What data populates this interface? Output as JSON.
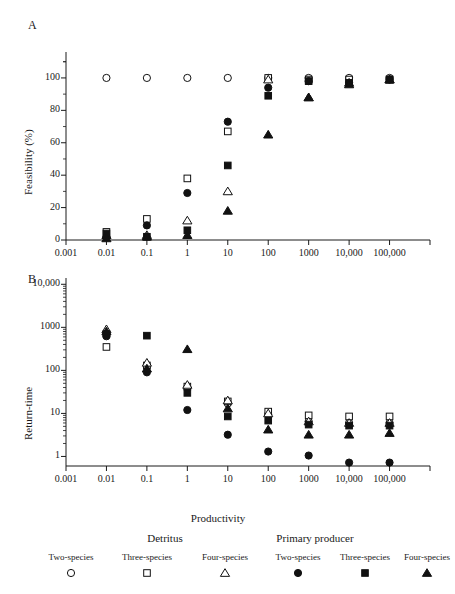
{
  "figure": {
    "panel_a_letter": "A",
    "panel_b_letter": "B",
    "xlabel": "Productivity"
  },
  "legend": {
    "group_detritus": "Detritus",
    "group_primary": "Primary producer",
    "entries": [
      {
        "label": "Two-species",
        "marker": "open-circle",
        "group": "Detritus"
      },
      {
        "label": "Three-species",
        "marker": "open-square",
        "group": "Detritus"
      },
      {
        "label": "Four-species",
        "marker": "open-triangle",
        "group": "Detritus"
      },
      {
        "label": "Two-species",
        "marker": "filled-circle",
        "group": "Primary producer"
      },
      {
        "label": "Three-species",
        "marker": "filled-square",
        "group": "Primary producer"
      },
      {
        "label": "Four-species",
        "marker": "filled-triangle",
        "group": "Primary producer"
      }
    ]
  },
  "chart_data": [
    {
      "type": "scatter",
      "panel": "A",
      "title": "",
      "xlabel": "Productivity",
      "ylabel": "Feasibility (%)",
      "xscale": "log",
      "yscale": "linear",
      "xlim": [
        0.001,
        1000000
      ],
      "ylim": [
        0,
        110
      ],
      "xticks": [
        0.001,
        0.01,
        0.1,
        1,
        10,
        100,
        1000,
        10000,
        100000
      ],
      "xticklabels": [
        "0.001",
        "0.01",
        "0.1",
        "1",
        "10",
        "100",
        "1000",
        "10,000",
        "100,000"
      ],
      "yticks": [
        0,
        20,
        40,
        60,
        80,
        100
      ],
      "yticklabels": [
        "0",
        "20",
        "40",
        "60",
        "80",
        "100"
      ],
      "grid": false,
      "legend_position": "below-figure",
      "series": [
        {
          "name": "Detritus Two-species",
          "marker": "open-circle",
          "x": [
            0.01,
            0.1,
            1,
            10,
            100,
            1000,
            10000,
            100000
          ],
          "y": [
            100,
            100,
            100,
            100,
            100,
            100,
            100,
            100
          ]
        },
        {
          "name": "Detritus Three-species",
          "marker": "open-square",
          "x": [
            0.01,
            0.1,
            1,
            10,
            100,
            1000,
            10000,
            100000
          ],
          "y": [
            5,
            13,
            38,
            67,
            100,
            99,
            99,
            99
          ]
        },
        {
          "name": "Detritus Four-species",
          "marker": "open-triangle",
          "x": [
            0.01,
            0.1,
            1,
            10,
            100,
            1000,
            10000,
            100000
          ],
          "y": [
            3,
            3,
            12,
            30,
            99,
            88,
            97,
            99
          ]
        },
        {
          "name": "Primary producer Two-species",
          "marker": "filled-circle",
          "x": [
            0.01,
            0.1,
            1,
            10,
            100,
            1000,
            10000,
            100000
          ],
          "y": [
            2,
            9,
            29,
            73,
            94,
            98,
            97,
            99
          ]
        },
        {
          "name": "Primary producer Three-species",
          "marker": "filled-square",
          "x": [
            0.01,
            0.1,
            1,
            10,
            100,
            1000,
            10000,
            100000
          ],
          "y": [
            4,
            2,
            6,
            46,
            89,
            98,
            97,
            99
          ]
        },
        {
          "name": "Primary producer Four-species",
          "marker": "filled-triangle",
          "x": [
            0.01,
            0.1,
            1,
            10,
            100,
            1000,
            10000,
            100000
          ],
          "y": [
            1,
            2,
            3,
            18,
            65,
            88,
            96,
            99
          ]
        }
      ]
    },
    {
      "type": "scatter",
      "panel": "B",
      "title": "",
      "xlabel": "Productivity",
      "ylabel": "Return-time",
      "xscale": "log",
      "yscale": "log",
      "xlim": [
        0.001,
        1000000
      ],
      "ylim": [
        0.7,
        10000
      ],
      "xticks": [
        0.001,
        0.01,
        0.1,
        1,
        10,
        100,
        1000,
        10000,
        100000
      ],
      "xticklabels": [
        "0.001",
        "0.01",
        "0.1",
        "1",
        "10",
        "100",
        "1000",
        "10,000",
        "100,000"
      ],
      "yticks": [
        1,
        10,
        100,
        1000,
        10000
      ],
      "yticklabels": [
        "1",
        "10",
        "100",
        "1000",
        "10,000"
      ],
      "grid": false,
      "legend_position": "below-figure",
      "series": [
        {
          "name": "Detritus Two-species",
          "marker": "open-circle",
          "x": [
            0.01,
            0.1,
            1,
            10,
            100,
            1000,
            10000,
            100000
          ],
          "y": [
            700,
            120,
            40,
            17,
            9.5,
            6.5,
            6,
            6
          ]
        },
        {
          "name": "Detritus Three-species",
          "marker": "open-square",
          "x": [
            0.01,
            0.1,
            1,
            10,
            100,
            1000,
            10000,
            100000
          ],
          "y": [
            350,
            130,
            42,
            19,
            11,
            9,
            8.5,
            8.5
          ]
        },
        {
          "name": "Detritus Four-species",
          "marker": "open-triangle",
          "x": [
            0.01,
            0.1,
            1,
            10,
            100,
            1000,
            10000,
            100000
          ],
          "y": [
            900,
            150,
            46,
            20,
            10,
            6.5,
            6,
            6
          ]
        },
        {
          "name": "Primary producer Two-species",
          "marker": "filled-circle",
          "x": [
            0.01,
            0.1,
            1,
            10,
            100,
            1000,
            10000,
            100000
          ],
          "y": [
            620,
            90,
            12,
            3.2,
            1.3,
            1.05,
            0.72,
            0.72
          ]
        },
        {
          "name": "Primary producer Three-species",
          "marker": "filled-square",
          "x": [
            0.01,
            0.1,
            1,
            10,
            100,
            1000,
            10000,
            100000
          ],
          "y": [
            700,
            640,
            30,
            8.5,
            6.8,
            5.5,
            5.2,
            5.2
          ]
        },
        {
          "name": "Primary producer Four-species",
          "marker": "filled-triangle",
          "x": [
            0.01,
            0.1,
            1,
            10,
            100,
            1000,
            10000,
            100000
          ],
          "y": [
            800,
            110,
            310,
            13,
            4.2,
            3.2,
            3.2,
            3.5
          ]
        }
      ]
    }
  ]
}
